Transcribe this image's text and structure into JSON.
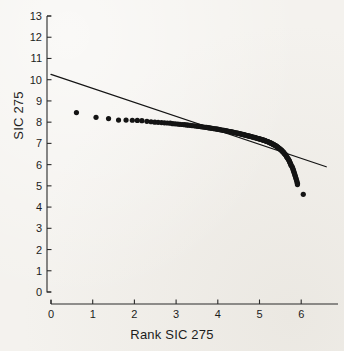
{
  "figure": {
    "background_color": "#f4f2ee",
    "ink_color": "#141414",
    "width": 344,
    "height": 351
  },
  "axis_titles": {
    "x": "Rank SIC 275",
    "y": "SIC 275"
  },
  "chart_data": {
    "type": "scatter",
    "title": "",
    "subtitle": "",
    "xlabel": "Rank SIC 275",
    "ylabel": "SIC 275",
    "xlim": [
      0,
      6.6
    ],
    "ylim": [
      0,
      13
    ],
    "grid": false,
    "legend": "none",
    "x_ticks": [
      0,
      1,
      2,
      3,
      4,
      5,
      6
    ],
    "x_tick_labels": [
      "0",
      "1",
      "2",
      "3",
      "4",
      "5",
      "6"
    ],
    "y_ticks": [
      0,
      1,
      2,
      3,
      4,
      5,
      6,
      7,
      8,
      9,
      10,
      11,
      12,
      13
    ],
    "y_tick_labels": [
      "0",
      "1",
      "2",
      "3",
      "4",
      "5",
      "6",
      "7",
      "8",
      "9",
      "10",
      "11",
      "12",
      "13"
    ],
    "series": [
      {
        "name": "rank-size points",
        "type": "scatter",
        "marker": "filled-circle",
        "marker_size": 2.6,
        "color": "#141414",
        "points": [
          [
            0.61,
            8.45
          ],
          [
            1.08,
            8.23
          ],
          [
            1.38,
            8.17
          ],
          [
            1.62,
            8.1
          ],
          [
            1.8,
            8.1
          ],
          [
            1.95,
            8.09
          ],
          [
            2.07,
            8.08
          ],
          [
            2.18,
            8.07
          ],
          [
            2.3,
            8.04
          ],
          [
            2.4,
            8.02
          ],
          [
            2.49,
            8.0
          ],
          [
            2.57,
            7.99
          ],
          [
            2.65,
            7.98
          ],
          [
            2.72,
            7.97
          ],
          [
            2.79,
            7.96
          ],
          [
            2.86,
            7.95
          ],
          [
            2.92,
            7.93
          ],
          [
            2.98,
            7.92
          ],
          [
            3.04,
            7.91
          ],
          [
            3.09,
            7.9
          ],
          [
            3.15,
            7.89
          ],
          [
            3.2,
            7.88
          ],
          [
            3.25,
            7.87
          ],
          [
            3.29,
            7.86
          ],
          [
            3.34,
            7.85
          ],
          [
            3.38,
            7.84
          ],
          [
            3.43,
            7.83
          ],
          [
            3.47,
            7.82
          ],
          [
            3.51,
            7.81
          ],
          [
            3.55,
            7.8
          ],
          [
            3.59,
            7.79
          ],
          [
            3.62,
            7.78
          ],
          [
            3.66,
            7.77
          ],
          [
            3.7,
            7.76
          ],
          [
            3.73,
            7.75
          ],
          [
            3.77,
            7.74
          ],
          [
            3.8,
            7.73
          ],
          [
            3.83,
            7.72
          ],
          [
            3.86,
            7.71
          ],
          [
            3.9,
            7.7
          ],
          [
            3.93,
            7.69
          ],
          [
            3.96,
            7.68
          ],
          [
            3.99,
            7.67
          ],
          [
            4.02,
            7.66
          ],
          [
            4.04,
            7.65
          ],
          [
            4.07,
            7.64
          ],
          [
            4.1,
            7.63
          ],
          [
            4.13,
            7.62
          ],
          [
            4.15,
            7.61
          ],
          [
            4.18,
            7.6
          ],
          [
            4.21,
            7.59
          ],
          [
            4.23,
            7.58
          ],
          [
            4.26,
            7.57
          ],
          [
            4.28,
            7.56
          ],
          [
            4.31,
            7.55
          ],
          [
            4.33,
            7.54
          ],
          [
            4.36,
            7.53
          ],
          [
            4.38,
            7.52
          ],
          [
            4.4,
            7.51
          ],
          [
            4.43,
            7.5
          ],
          [
            4.45,
            7.49
          ],
          [
            4.47,
            7.48
          ],
          [
            4.49,
            7.47
          ],
          [
            4.52,
            7.46
          ],
          [
            4.54,
            7.45
          ],
          [
            4.56,
            7.44
          ],
          [
            4.58,
            7.43
          ],
          [
            4.6,
            7.42
          ],
          [
            4.62,
            7.41
          ],
          [
            4.64,
            7.4
          ],
          [
            4.66,
            7.39
          ],
          [
            4.68,
            7.38
          ],
          [
            4.7,
            7.37
          ],
          [
            4.72,
            7.36
          ],
          [
            4.74,
            7.35
          ],
          [
            4.76,
            7.34
          ],
          [
            4.78,
            7.33
          ],
          [
            4.8,
            7.32
          ],
          [
            4.82,
            7.31
          ],
          [
            4.84,
            7.3
          ],
          [
            4.86,
            7.29
          ],
          [
            4.88,
            7.28
          ],
          [
            4.89,
            7.27
          ],
          [
            4.91,
            7.26
          ],
          [
            4.93,
            7.25
          ],
          [
            4.95,
            7.24
          ],
          [
            4.97,
            7.23
          ],
          [
            4.98,
            7.22
          ],
          [
            5.0,
            7.21
          ],
          [
            5.02,
            7.2
          ],
          [
            5.04,
            7.19
          ],
          [
            5.05,
            7.18
          ],
          [
            5.07,
            7.17
          ],
          [
            5.09,
            7.16
          ],
          [
            5.1,
            7.15
          ],
          [
            5.12,
            7.14
          ],
          [
            5.14,
            7.13
          ],
          [
            5.15,
            7.11
          ],
          [
            5.17,
            7.1
          ],
          [
            5.19,
            7.09
          ],
          [
            5.2,
            7.08
          ],
          [
            5.22,
            7.06
          ],
          [
            5.23,
            7.05
          ],
          [
            5.25,
            7.04
          ],
          [
            5.26,
            7.02
          ],
          [
            5.28,
            7.01
          ],
          [
            5.29,
            6.99
          ],
          [
            5.31,
            6.98
          ],
          [
            5.32,
            6.96
          ],
          [
            5.34,
            6.95
          ],
          [
            5.35,
            6.93
          ],
          [
            5.37,
            6.91
          ],
          [
            5.38,
            6.9
          ],
          [
            5.4,
            6.88
          ],
          [
            5.41,
            6.86
          ],
          [
            5.42,
            6.84
          ],
          [
            5.44,
            6.82
          ],
          [
            5.45,
            6.8
          ],
          [
            5.46,
            6.78
          ],
          [
            5.48,
            6.76
          ],
          [
            5.49,
            6.74
          ],
          [
            5.5,
            6.72
          ],
          [
            5.52,
            6.7
          ],
          [
            5.53,
            6.67
          ],
          [
            5.54,
            6.65
          ],
          [
            5.55,
            6.62
          ],
          [
            5.57,
            6.6
          ],
          [
            5.58,
            6.57
          ],
          [
            5.59,
            6.54
          ],
          [
            5.6,
            6.51
          ],
          [
            5.62,
            6.48
          ],
          [
            5.63,
            6.45
          ],
          [
            5.64,
            6.42
          ],
          [
            5.65,
            6.38
          ],
          [
            5.66,
            6.35
          ],
          [
            5.67,
            6.31
          ],
          [
            5.69,
            6.27
          ],
          [
            5.7,
            6.23
          ],
          [
            5.71,
            6.19
          ],
          [
            5.72,
            6.15
          ],
          [
            5.73,
            6.1
          ],
          [
            5.74,
            6.06
          ],
          [
            5.75,
            6.01
          ],
          [
            5.76,
            5.96
          ],
          [
            5.78,
            5.91
          ],
          [
            5.79,
            5.86
          ],
          [
            5.8,
            5.8
          ],
          [
            5.81,
            5.75
          ],
          [
            5.82,
            5.69
          ],
          [
            5.83,
            5.63
          ],
          [
            5.84,
            5.57
          ],
          [
            5.85,
            5.51
          ],
          [
            5.86,
            5.45
          ],
          [
            5.87,
            5.38
          ],
          [
            5.88,
            5.32
          ],
          [
            5.89,
            5.25
          ],
          [
            5.9,
            5.18
          ],
          [
            5.91,
            5.12
          ],
          [
            5.91,
            5.06
          ],
          [
            6.05,
            4.6
          ]
        ]
      },
      {
        "name": "fitted regression line",
        "type": "line",
        "color": "#141414",
        "line_width": 1.3,
        "endpoints": [
          [
            0.0,
            10.25
          ],
          [
            6.6,
            5.9
          ]
        ],
        "intercept": 10.25,
        "slope": -0.659
      }
    ]
  }
}
